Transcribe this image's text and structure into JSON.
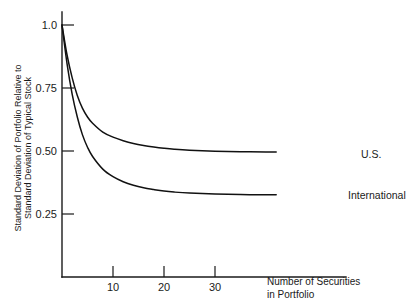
{
  "chart_data": {
    "type": "line",
    "title": "",
    "xlabel": "Number of Securities in Portfolio",
    "xlabel_line1": "Number of Securities",
    "xlabel_line2": "in Portfolio",
    "ylabel": "Standard Deviation of Portfolio Relative to Standard Deviation of Typical Stock",
    "ylabel_line1": "Standard Deviation of Portfolio Relative to",
    "ylabel_line2": "Standard Deviation of Typical Stock",
    "xlim": [
      0,
      42
    ],
    "ylim": [
      0,
      1.05
    ],
    "grid": false,
    "legend_position": "inline-right-of-curve-ends",
    "x_ticks": [
      10,
      20,
      30
    ],
    "x_tick_labels": [
      "10",
      "20",
      "30"
    ],
    "y_ticks": [
      0.25,
      0.5,
      0.75,
      1.0
    ],
    "y_tick_labels": [
      "0.25",
      "0.50",
      "0.75",
      "1.0"
    ],
    "line_color": "#111111",
    "axis_color": "#1a1a1a",
    "series": [
      {
        "name": "U.S.",
        "label": "U.S.",
        "x": [
          0,
          1,
          2,
          3,
          4,
          5,
          6,
          8,
          10,
          12,
          14,
          16,
          18,
          20,
          22,
          25,
          30,
          35,
          40,
          42
        ],
        "values": [
          1.0,
          0.88,
          0.79,
          0.72,
          0.67,
          0.635,
          0.61,
          0.575,
          0.555,
          0.541,
          0.53,
          0.522,
          0.516,
          0.511,
          0.507,
          0.503,
          0.499,
          0.497,
          0.496,
          0.496
        ]
      },
      {
        "name": "International",
        "label": "International",
        "x": [
          0,
          1,
          2,
          3,
          4,
          5,
          6,
          8,
          10,
          12,
          14,
          16,
          18,
          20,
          22,
          25,
          30,
          35,
          40,
          42
        ],
        "values": [
          1.0,
          0.845,
          0.725,
          0.635,
          0.565,
          0.515,
          0.478,
          0.428,
          0.398,
          0.378,
          0.364,
          0.354,
          0.347,
          0.341,
          0.337,
          0.333,
          0.329,
          0.327,
          0.326,
          0.326
        ]
      }
    ]
  }
}
